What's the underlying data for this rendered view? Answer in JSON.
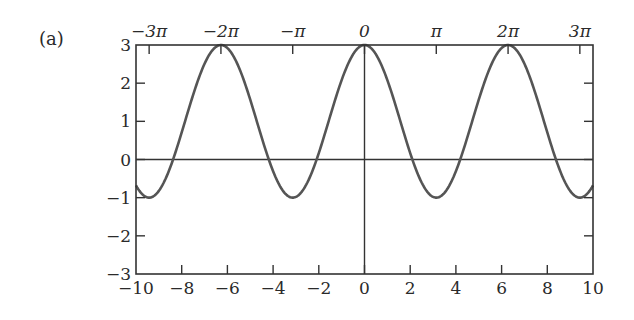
{
  "panel_label": "(a)",
  "chart_data": {
    "type": "line",
    "title": "",
    "function": "2cos(x) + 1",
    "xlabel": "",
    "ylabel": "",
    "xlim": [
      -10,
      10
    ],
    "ylim": [
      -3,
      3
    ],
    "grid": false,
    "legend": null,
    "bottom_x_ticks": [
      -10,
      -8,
      -6,
      -4,
      -2,
      0,
      2,
      4,
      6,
      8,
      10
    ],
    "bottom_x_tick_labels": [
      "−10",
      "−8",
      "−6",
      "−4",
      "−2",
      "0",
      "2",
      "4",
      "6",
      "8",
      "10"
    ],
    "top_x_ticks": [
      -9.42478,
      -6.28319,
      -3.14159,
      0,
      3.14159,
      6.28319,
      9.42478
    ],
    "top_x_tick_labels": [
      "−3π",
      "−2π",
      "−π",
      "0",
      "π",
      "2π",
      "3π"
    ],
    "y_ticks": [
      -3,
      -2,
      -1,
      0,
      1,
      2,
      3
    ],
    "y_tick_labels": [
      "−3",
      "−2",
      "−1",
      "0",
      "1",
      "2",
      "3"
    ],
    "reference_lines": [
      {
        "axis": "y",
        "value": 0
      },
      {
        "axis": "x",
        "value": 0
      }
    ],
    "series": [
      {
        "name": "2cos(x)+1",
        "color": "#555555",
        "x": [
          -10,
          -9.42,
          -8,
          -7,
          -6.28,
          -5,
          -4,
          -3.14,
          -2,
          -1,
          0,
          1,
          2,
          3.14,
          4,
          5,
          6.28,
          7,
          8,
          9.42,
          10
        ],
        "y": [
          -0.68,
          -1.0,
          -0.29,
          2.51,
          3.0,
          1.57,
          -0.31,
          -1.0,
          0.17,
          2.08,
          3.0,
          2.08,
          0.17,
          -1.0,
          -0.31,
          1.57,
          3.0,
          2.51,
          -0.29,
          -1.0,
          -0.68
        ]
      }
    ],
    "colors": {
      "axis": "#333333",
      "curve": "#555555"
    }
  },
  "layout": {
    "plot_left": 136,
    "plot_right": 593,
    "plot_top": 45,
    "plot_bottom": 274
  }
}
